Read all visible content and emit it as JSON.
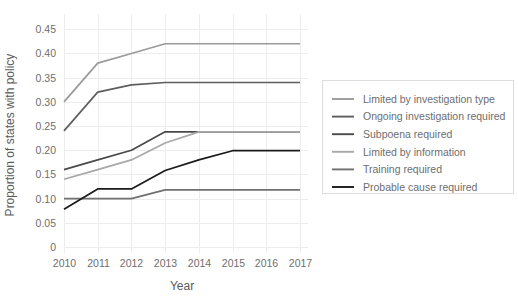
{
  "chart_data": {
    "type": "line",
    "title": "",
    "xlabel": "Year",
    "ylabel": "Proportion of states with policy",
    "x": [
      2010,
      2011,
      2012,
      2013,
      2014,
      2015,
      2016,
      2017
    ],
    "xticklabels": [
      "2010",
      "2011",
      "2012",
      "2013",
      "2014",
      "2015",
      "2016",
      "2017"
    ],
    "yticks": [
      0,
      0.05,
      0.1,
      0.15,
      0.2,
      0.25,
      0.3,
      0.35,
      0.4,
      0.45
    ],
    "yticklabels": [
      "0",
      "0.05",
      "0.10",
      "0.15",
      "0.20",
      "0.25",
      "0.30",
      "0.35",
      "0.40",
      "0.45"
    ],
    "ylim": [
      0,
      0.465
    ],
    "xlim": [
      2010,
      2017
    ],
    "grid": true,
    "legend_position": "right",
    "series": [
      {
        "name": "Limited by investigation type",
        "color": "#9a9a9a",
        "values": [
          0.3,
          0.38,
          0.4,
          0.42,
          0.42,
          0.42,
          0.42,
          0.42
        ]
      },
      {
        "name": "Ongoing investigation required",
        "color": "#5e5e5e",
        "values": [
          0.24,
          0.32,
          0.335,
          0.34,
          0.34,
          0.34,
          0.34,
          0.34
        ]
      },
      {
        "name": "Subpoena required",
        "color": "#4a4a4a",
        "values": [
          0.16,
          0.18,
          0.2,
          0.238,
          0.238,
          0.238,
          0.238,
          0.238
        ]
      },
      {
        "name": "Limited by information",
        "color": "#a8a8a8",
        "values": [
          0.14,
          0.16,
          0.18,
          0.215,
          0.238,
          0.238,
          0.238,
          0.238
        ]
      },
      {
        "name": "Training required",
        "color": "#707070",
        "values": [
          0.1,
          0.1,
          0.1,
          0.118,
          0.118,
          0.118,
          0.118,
          0.118
        ]
      },
      {
        "name": "Probable cause required",
        "color": "#1a1a1a",
        "values": [
          0.078,
          0.12,
          0.12,
          0.158,
          0.18,
          0.199,
          0.199,
          0.199
        ]
      }
    ]
  }
}
